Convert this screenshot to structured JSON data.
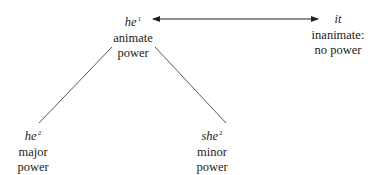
{
  "nodes": {
    "he1": {
      "pronoun": "he",
      "superscript": "1",
      "lines": [
        "animate",
        "power"
      ]
    },
    "it": {
      "pronoun": "it",
      "superscript": "",
      "lines": [
        "inanimate:",
        "no power"
      ]
    },
    "he2": {
      "pronoun": "he",
      "superscript": "2",
      "lines": [
        "major",
        "power"
      ]
    },
    "she2": {
      "pronoun": "she",
      "superscript": "2",
      "lines": [
        "minor",
        "power"
      ]
    }
  },
  "edges": [
    {
      "from": "he1",
      "to": "it",
      "type": "double-arrow"
    },
    {
      "from": "he1",
      "to": "he2",
      "type": "line"
    },
    {
      "from": "he1",
      "to": "she2",
      "type": "line"
    }
  ]
}
